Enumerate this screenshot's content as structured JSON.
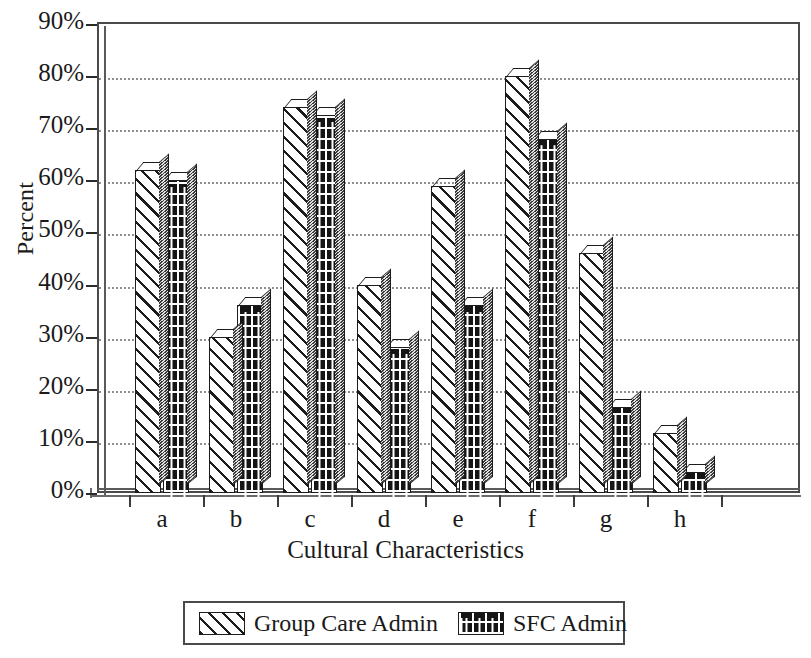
{
  "chart_data": {
    "type": "bar",
    "title": "",
    "xlabel": "Cultural Characteristics",
    "ylabel": "Percent",
    "categories": [
      "a",
      "b",
      "c",
      "d",
      "e",
      "f",
      "g",
      "h"
    ],
    "ylim": [
      0,
      90
    ],
    "y_ticks": [
      "0%",
      "10%",
      "20%",
      "30%",
      "40%",
      "50%",
      "60%",
      "70%",
      "80%",
      "90%"
    ],
    "y_tick_values": [
      0,
      10,
      20,
      30,
      40,
      50,
      60,
      70,
      80,
      90
    ],
    "grid": "horizontal-dotted",
    "legend_position": "bottom",
    "series": [
      {
        "name": "Group Care Admin",
        "pattern": "diagonal-hatch",
        "values": [
          62,
          30,
          74,
          40,
          59,
          80,
          46,
          11.5
        ]
      },
      {
        "name": "SFC Admin",
        "pattern": "brick",
        "values": [
          60,
          36,
          72.5,
          28,
          36,
          68,
          16.5,
          4
        ]
      }
    ]
  },
  "axes": {
    "y_title": "Percent",
    "x_title": "Cultural Characteristics"
  },
  "legend": {
    "entries": [
      {
        "label": "Group Care Admin",
        "pattern": "diagonal-hatch"
      },
      {
        "label": "SFC Admin",
        "pattern": "brick"
      }
    ]
  },
  "colors": {
    "background": "#ffffff",
    "axis": "#2b2b2b",
    "frame": "#4a4a4a",
    "gridline": "#8f8f8f",
    "bar_outline": "#1c1c1c",
    "series1_fill": "#ffffff",
    "series2_fill": "#151515"
  }
}
